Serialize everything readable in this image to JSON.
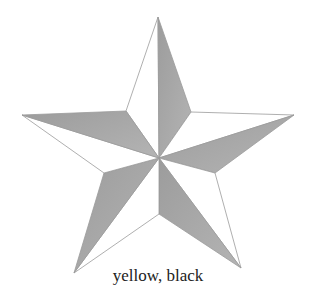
{
  "caption": "yellow, black",
  "star": {
    "outer_points": [
      [
        158,
        17
      ],
      [
        294,
        115
      ],
      [
        241,
        268
      ],
      [
        74,
        273
      ],
      [
        22,
        115
      ]
    ],
    "inner_points": [
      [
        191,
        112
      ],
      [
        215,
        173
      ],
      [
        159,
        214
      ],
      [
        104,
        173
      ],
      [
        126,
        111
      ]
    ],
    "center": [
      159,
      158
    ],
    "colors": {
      "light": "#ffffff",
      "shade": "#a8a8a8",
      "outline": "#9a9a9a"
    }
  }
}
